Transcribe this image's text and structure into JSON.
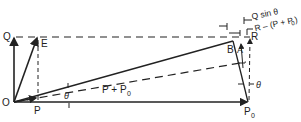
{
  "diagram": {
    "points": {
      "O": "O",
      "Q": "Q",
      "E": "E",
      "P": "P",
      "P0": "P",
      "P0_sub": "0",
      "R": "R",
      "A": "A",
      "B": "B"
    },
    "labels": {
      "sum_line": "P + P",
      "sum_line_sub": "0",
      "theta_1": "θ",
      "theta_2": "θ",
      "q_sin": "Q sin θ",
      "r_minus": "R – (P + P",
      "r_minus_sub": "0",
      "r_minus_close": ")"
    },
    "colors": {
      "ink": "#222222",
      "background": "#ffffff"
    }
  }
}
